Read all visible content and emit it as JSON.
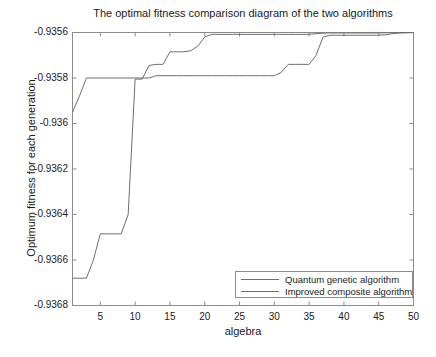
{
  "chart_data": {
    "type": "line",
    "title": "The optimal fitness comparison diagram of the two algorithms",
    "xlabel": "algebra",
    "ylabel": "Optimum fitness for each generation",
    "xlim": [
      1,
      50
    ],
    "ylim": [
      -0.9368,
      -0.9356
    ],
    "xticks": [
      5,
      10,
      15,
      20,
      25,
      30,
      35,
      40,
      45,
      50
    ],
    "xticklabels": [
      "5",
      "10",
      "15",
      "20",
      "25",
      "30",
      "35",
      "40",
      "45",
      "50"
    ],
    "yticks": [
      -0.9356,
      -0.9358,
      -0.936,
      -0.9362,
      -0.9364,
      -0.9366,
      -0.9368
    ],
    "yticklabels": [
      "-0.9356",
      "-0.9358",
      "-0.936",
      "-0.9362",
      "-0.9364",
      "-0.9366",
      "-0.9368"
    ],
    "grid": false,
    "legend_position": "lower right",
    "x": [
      1,
      2,
      3,
      4,
      5,
      6,
      7,
      8,
      9,
      10,
      11,
      12,
      13,
      14,
      15,
      16,
      17,
      18,
      19,
      20,
      21,
      22,
      23,
      24,
      25,
      26,
      27,
      28,
      29,
      30,
      31,
      32,
      33,
      34,
      35,
      36,
      37,
      38,
      39,
      40,
      41,
      42,
      43,
      44,
      45,
      46,
      47,
      48,
      49,
      50
    ],
    "series": [
      {
        "name": "Quantum genetic algorithm",
        "color": "#6e6e6e",
        "values": [
          -0.93668,
          -0.93668,
          -0.93668,
          -0.9366,
          -0.936485,
          -0.936485,
          -0.936485,
          -0.936485,
          -0.9364,
          -0.935805,
          -0.935805,
          -0.935745,
          -0.93574,
          -0.93574,
          -0.935685,
          -0.935685,
          -0.935685,
          -0.93568,
          -0.93566,
          -0.93562,
          -0.935608,
          -0.935608,
          -0.935608,
          -0.935608,
          -0.935608,
          -0.935608,
          -0.935608,
          -0.935608,
          -0.935608,
          -0.935608,
          -0.935608,
          -0.935608,
          -0.935608,
          -0.935608,
          -0.935608,
          -0.935605,
          -0.935603,
          -0.935602,
          -0.935602,
          -0.935602,
          -0.935602,
          -0.935602,
          -0.935602,
          -0.935602,
          -0.935602,
          -0.935601,
          -0.935601,
          -0.935601,
          -0.935601,
          -0.9356
        ]
      },
      {
        "name": "Improved composite algorithm",
        "color": "#6e6e6e",
        "values": [
          -0.93595,
          -0.93588,
          -0.9358,
          -0.9358,
          -0.9358,
          -0.9358,
          -0.9358,
          -0.9358,
          -0.9358,
          -0.9358,
          -0.9358,
          -0.9358,
          -0.93579,
          -0.93579,
          -0.93579,
          -0.93579,
          -0.93579,
          -0.93579,
          -0.93579,
          -0.93579,
          -0.93579,
          -0.93579,
          -0.93579,
          -0.93579,
          -0.93579,
          -0.93579,
          -0.93579,
          -0.93579,
          -0.93579,
          -0.93579,
          -0.935775,
          -0.93574,
          -0.93574,
          -0.93574,
          -0.93574,
          -0.9357,
          -0.93562,
          -0.935612,
          -0.935612,
          -0.935612,
          -0.935612,
          -0.935612,
          -0.935612,
          -0.935612,
          -0.935612,
          -0.93561,
          -0.935605,
          -0.935602,
          -0.935601,
          -0.9356
        ]
      }
    ]
  },
  "legend": {
    "entries": [
      {
        "label": "Quantum genetic algorithm"
      },
      {
        "label": "Improved composite algorithm"
      }
    ]
  },
  "axes": {
    "color": "#8c8c8c"
  }
}
